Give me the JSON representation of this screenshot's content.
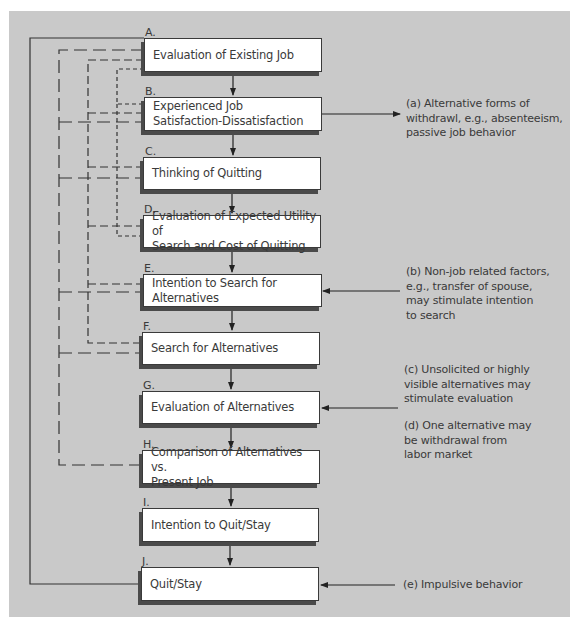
{
  "diagram": {
    "type": "flowchart",
    "title": "",
    "steps": [
      {
        "letter": "A.",
        "label": "Evaluation of Existing Job"
      },
      {
        "letter": "B.",
        "label": "Experienced Job\nSatisfaction-Dissatisfaction"
      },
      {
        "letter": "C.",
        "label": "Thinking of Quitting"
      },
      {
        "letter": "D.",
        "label": "Evaluation of Expected Utility of\nSearch and Cost of Quitting"
      },
      {
        "letter": "E.",
        "label": "Intention to Search for Alternatives"
      },
      {
        "letter": "F.",
        "label": "Search for Alternatives"
      },
      {
        "letter": "G.",
        "label": "Evaluation of Alternatives"
      },
      {
        "letter": "H.",
        "label": "Comparison of Alternatives vs.\nPresent Job"
      },
      {
        "letter": "I.",
        "label": "Intention to Quit/Stay"
      },
      {
        "letter": "J.",
        "label": "Quit/Stay"
      }
    ],
    "notes": {
      "a": "(a) Alternative forms of\nwithdrawl, e.g., absenteeism,\npassive job behavior",
      "b": "(b) Non-job related factors,\ne.g., transfer of spouse,\nmay stimulate intention\nto search",
      "c": "(c) Unsolicited or highly\nvisible alternatives may\nstimulate evaluation",
      "d": "(d) One alternative may\nbe withdrawal from\nlabor market",
      "e": "(e) Impulsive behavior"
    },
    "edges": [
      {
        "from": "A",
        "to": "B",
        "style": "solid"
      },
      {
        "from": "B",
        "to": "C",
        "style": "solid"
      },
      {
        "from": "C",
        "to": "D",
        "style": "solid"
      },
      {
        "from": "D",
        "to": "E",
        "style": "solid"
      },
      {
        "from": "E",
        "to": "F",
        "style": "solid"
      },
      {
        "from": "F",
        "to": "G",
        "style": "solid"
      },
      {
        "from": "G",
        "to": "H",
        "style": "solid"
      },
      {
        "from": "H",
        "to": "I",
        "style": "solid"
      },
      {
        "from": "I",
        "to": "J",
        "style": "solid"
      },
      {
        "from": "B",
        "to": "note-a",
        "style": "solid-arrow"
      },
      {
        "from": "note-b",
        "to": "E",
        "style": "solid-arrow"
      },
      {
        "from": "note-c-d",
        "to": "G",
        "style": "solid-arrow"
      },
      {
        "from": "note-e",
        "to": "J",
        "style": "solid-arrow"
      },
      {
        "from": "J",
        "to": "A",
        "style": "solid-feedback"
      },
      {
        "from": "A",
        "to": [
          "B",
          "C",
          "E",
          "F",
          "H"
        ],
        "style": "long-dash"
      },
      {
        "from": "A",
        "to": [
          "B",
          "C",
          "D",
          "E",
          "F"
        ],
        "style": "medium-dash"
      },
      {
        "from": "A",
        "to": [
          "B",
          "D"
        ],
        "style": "short-dash"
      }
    ],
    "colors": {
      "panel": "#c9c9c9",
      "box": "#ffffff",
      "line": "#333333",
      "shadow": "#4a4a4a",
      "text": "#3a3a3a"
    }
  }
}
